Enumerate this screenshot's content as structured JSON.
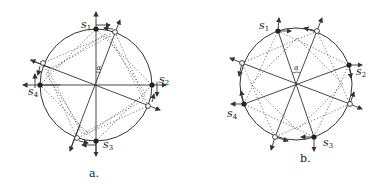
{
  "panels": [
    {
      "caption": "a.",
      "angle_label": "α",
      "center": [
        96,
        85
      ],
      "radius": 56,
      "filled_points": [
        {
          "label": "s",
          "sub": "1",
          "pos": [
            96,
            29
          ]
        },
        {
          "label": "s",
          "sub": "2",
          "pos": [
            152,
            85
          ]
        },
        {
          "label": "s",
          "sub": "3",
          "pos": [
            96,
            141
          ]
        },
        {
          "label": "s",
          "sub": "4",
          "pos": [
            40,
            85
          ]
        }
      ],
      "open_points": [
        [
          115,
          32
        ],
        [
          148,
          106
        ],
        [
          77,
          138
        ],
        [
          43,
          63
        ]
      ]
    },
    {
      "caption": "b.",
      "angle_label": "α",
      "center": [
        296,
        84
      ],
      "radius": 56,
      "filled_points": [
        {
          "label": "s",
          "sub": "1",
          "pos": [
            278,
            31
          ]
        },
        {
          "label": "s",
          "sub": "2",
          "pos": [
            349,
            65
          ]
        },
        {
          "label": "s",
          "sub": "3",
          "pos": [
            314,
            137
          ]
        },
        {
          "label": "s",
          "sub": "4",
          "pos": [
            244,
            104
          ]
        }
      ],
      "open_points": [
        [
          317,
          31
        ],
        [
          350,
          104
        ],
        [
          275,
          137
        ],
        [
          242,
          63
        ]
      ]
    }
  ],
  "colors": {
    "stroke": "#333333",
    "fill": "#222222",
    "open_fill": "#ffffff",
    "dotted": "#555555"
  }
}
